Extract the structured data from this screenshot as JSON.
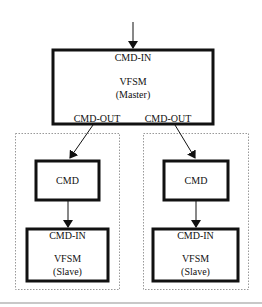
{
  "master": {
    "input_port": "CMD-IN",
    "title": "VFSM",
    "subtitle": "(Master)",
    "output_ports": [
      "CMD-OUT",
      "CMD-OUT"
    ]
  },
  "branches": [
    {
      "cmd_label": "CMD",
      "slave": {
        "input_port": "CMD-IN",
        "title": "VFSM",
        "subtitle": "(Slave)"
      }
    },
    {
      "cmd_label": "CMD",
      "slave": {
        "input_port": "CMD-IN",
        "title": "VFSM",
        "subtitle": "(Slave)"
      }
    }
  ]
}
